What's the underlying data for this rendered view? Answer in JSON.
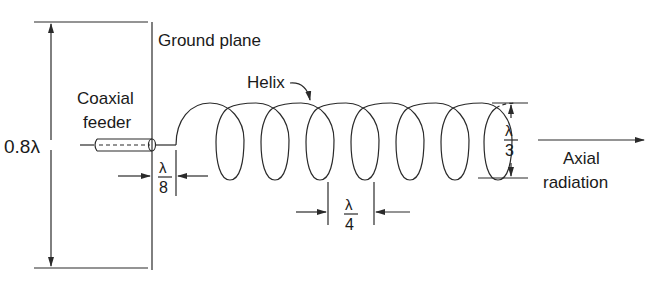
{
  "diagram": {
    "labels": {
      "ground_plane": "Ground plane",
      "helix": "Helix",
      "coaxial": "Coaxial",
      "feeder": "feeder",
      "ground_plane_size": "0.8λ",
      "spacing_num": "λ",
      "spacing_den": "8",
      "pitch_num": "λ",
      "pitch_den": "4",
      "diameter_num": "λ",
      "diameter_den": "3",
      "axial": "Axial",
      "radiation": "radiation"
    },
    "colors": {
      "line": "#2a2a2a",
      "background": "#ffffff"
    }
  }
}
